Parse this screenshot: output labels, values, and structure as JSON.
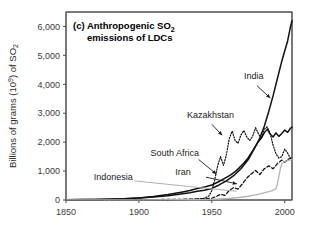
{
  "figure": {
    "panel_tag": "(c)",
    "title_line1": "(c) Anthropogenic SO",
    "title_sub1": "2",
    "title_line2": "emissions of LDCs",
    "background_color": "#ffffff",
    "frame_color": "#4d4d4d"
  },
  "chart_data": {
    "type": "line",
    "title": "(c) Anthropogenic SO2 emissions of LDCs",
    "xlabel": "",
    "ylabel": "Billions of grams (10^9) of SO2",
    "ylabel_main": "Billions of grams (10",
    "ylabel_exp": "9",
    "ylabel_tail": ") of SO",
    "ylabel_sub": "2",
    "xlim": [
      1850,
      2005
    ],
    "ylim": [
      0,
      6500
    ],
    "grid": false,
    "legend_position": "inline-annotations",
    "xticks": [
      1850,
      1900,
      1950,
      2000
    ],
    "xtick_labels": [
      "1850",
      "1900",
      "1950",
      "2000"
    ],
    "yticks": [
      0,
      1000,
      2000,
      3000,
      4000,
      5000,
      6000
    ],
    "ytick_labels": [
      "0",
      "1,000",
      "2,000",
      "3,000",
      "4,000",
      "5,000",
      "6,000"
    ],
    "series": [
      {
        "name": "India",
        "style": "solid",
        "color": "#111111",
        "width": 1.5,
        "label": "India",
        "label_x": 1972,
        "label_y": 4180,
        "arrow_from": [
          1981,
          3950
        ],
        "arrow_to": [
          1990,
          3530
        ],
        "x": [
          1850,
          1860,
          1870,
          1880,
          1890,
          1900,
          1910,
          1920,
          1930,
          1935,
          1940,
          1945,
          1950,
          1955,
          1960,
          1965,
          1970,
          1975,
          1980,
          1983,
          1986,
          1989,
          1992,
          1995,
          1998,
          2000,
          2002,
          2004,
          2005
        ],
        "values": [
          10,
          14,
          20,
          30,
          45,
          70,
          105,
          150,
          215,
          250,
          300,
          340,
          400,
          520,
          660,
          840,
          1080,
          1400,
          1850,
          2150,
          2550,
          3050,
          3600,
          4200,
          4800,
          5150,
          5500,
          6000,
          6200
        ]
      },
      {
        "name": "South Africa",
        "style": "solid",
        "color": "#111111",
        "width": 1.5,
        "label": "South Africa",
        "label_x": 1908,
        "label_y": 1530,
        "arrow_from": [
          1941,
          1400
        ],
        "arrow_to": [
          1953,
          900
        ],
        "x": [
          1850,
          1870,
          1890,
          1900,
          1910,
          1920,
          1930,
          1935,
          1940,
          1945,
          1950,
          1955,
          1960,
          1963,
          1966,
          1969,
          1972,
          1975,
          1978,
          1981,
          1984,
          1986,
          1988,
          1990,
          1992,
          1994,
          1996,
          1998,
          2000,
          2002,
          2004,
          2005
        ],
        "values": [
          8,
          16,
          40,
          70,
          120,
          190,
          280,
          330,
          400,
          450,
          520,
          640,
          780,
          870,
          980,
          1120,
          1280,
          1460,
          1700,
          1950,
          2150,
          2320,
          2450,
          2280,
          2180,
          2320,
          2200,
          2300,
          2420,
          2340,
          2480,
          2520
        ]
      },
      {
        "name": "Kazakhstan",
        "style": "dotted",
        "color": "#111111",
        "width": 1.2,
        "label": "Kazakhstan",
        "label_x": 1933,
        "label_y": 2820,
        "arrow_from": [
          1950,
          2620
        ],
        "arrow_to": [
          1957,
          2240
        ],
        "x": [
          1850,
          1900,
          1930,
          1940,
          1945,
          1948,
          1950,
          1952,
          1954,
          1956,
          1958,
          1960,
          1962,
          1964,
          1966,
          1968,
          1970,
          1972,
          1974,
          1976,
          1978,
          1980,
          1982,
          1984,
          1986,
          1988,
          1990,
          1992,
          1994,
          1996,
          1998,
          2000,
          2002,
          2004,
          2005
        ],
        "values": [
          0,
          0,
          10,
          30,
          60,
          140,
          320,
          700,
          1180,
          1500,
          1200,
          1560,
          2130,
          2380,
          2050,
          1960,
          2250,
          2400,
          2180,
          2060,
          2200,
          2500,
          2290,
          2120,
          2450,
          2530,
          2300,
          1900,
          1600,
          1450,
          1500,
          1760,
          1620,
          1440,
          1420
        ]
      },
      {
        "name": "Iran",
        "style": "dashed",
        "color": "#111111",
        "width": 1.3,
        "label": "Iran",
        "label_x": 1925,
        "label_y": 880,
        "arrow_from": [
          1946,
          790
        ],
        "arrow_to": [
          1967,
          560
        ],
        "x": [
          1850,
          1880,
          1900,
          1920,
          1930,
          1940,
          1945,
          1950,
          1953,
          1956,
          1959,
          1962,
          1965,
          1968,
          1971,
          1974,
          1977,
          1980,
          1983,
          1986,
          1989,
          1992,
          1995,
          1998,
          2000,
          2002,
          2004,
          2005
        ],
        "values": [
          5,
          8,
          12,
          18,
          25,
          35,
          45,
          60,
          120,
          200,
          160,
          330,
          430,
          380,
          560,
          760,
          900,
          1020,
          880,
          1080,
          1180,
          1080,
          1260,
          1380,
          1300,
          1400,
          1440,
          1520
        ]
      },
      {
        "name": "Indonesia",
        "style": "solid",
        "color": "#b4b4b4",
        "width": 1.3,
        "label": "Indonesia",
        "label_x": 1869,
        "label_y": 700,
        "leader_from": [
          1897,
          660
        ],
        "leader_to": [
          1967,
          300
        ],
        "x": [
          1850,
          1900,
          1930,
          1940,
          1950,
          1955,
          1960,
          1965,
          1970,
          1975,
          1980,
          1984,
          1987,
          1990,
          1992,
          1994,
          1995,
          1996,
          1997,
          1998,
          2000,
          2002,
          2004,
          2005
        ],
        "values": [
          2,
          5,
          10,
          15,
          25,
          35,
          50,
          70,
          95,
          130,
          175,
          220,
          260,
          300,
          340,
          390,
          560,
          820,
          1080,
          1250,
          1330,
          1360,
          1390,
          1400
        ]
      }
    ]
  }
}
